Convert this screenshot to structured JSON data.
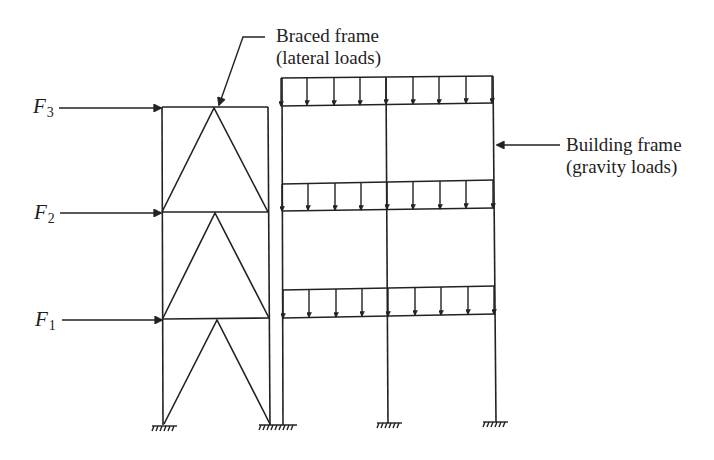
{
  "diagram": {
    "stroke_color": "#222222",
    "background": "#ffffff",
    "callouts": {
      "braced_frame": {
        "line1": "Braced frame",
        "line2": "(lateral loads)"
      },
      "building_frame": {
        "line1": "Building frame",
        "line2": "(gravity loads)"
      }
    },
    "forces": [
      {
        "symbol": "F",
        "subscript": "3",
        "level": "roof"
      },
      {
        "symbol": "F",
        "subscript": "2",
        "level": "second floor"
      },
      {
        "symbol": "F",
        "subscript": "1",
        "level": "first floor"
      }
    ],
    "braced_frame": {
      "stories": 3,
      "bracing": "chevron (inverted V)",
      "supports": 2
    },
    "building_frame": {
      "bays": 2,
      "columns": 3,
      "floors_with_gravity_load": 3,
      "arrows_per_floor": 9,
      "supports": 3
    }
  }
}
